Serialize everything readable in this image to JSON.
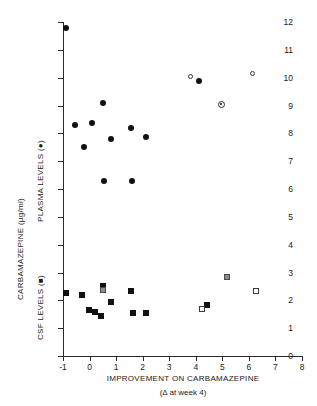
{
  "chart_data": {
    "type": "scatter",
    "title": "",
    "xlabel": "IMPROVEMENT ON CARBAMAZEPINE",
    "xlabel_sub": "(Δ at week 4)",
    "ylabel": "CARBAMAZEPINE (µg/ml)",
    "ylabel_upper": "PLASMA LEVELS (●)",
    "ylabel_lower": "CSF LEVELS (■)",
    "xlim": [
      -1,
      8
    ],
    "ylim": [
      0,
      12
    ],
    "xticks": [
      -1,
      0,
      1,
      2,
      3,
      4,
      5,
      6,
      7,
      8
    ],
    "xtick_labels": [
      "-1",
      "0",
      "1",
      "2",
      "3",
      "4",
      "5",
      "6",
      "7",
      "8"
    ],
    "yticks": [
      0,
      1,
      2,
      3,
      4,
      5,
      6,
      7,
      8,
      9,
      10,
      11,
      12
    ],
    "ytick_labels": [
      "0",
      "1",
      "2",
      "3",
      "4",
      "5",
      "6",
      "7",
      "8",
      "9",
      "10",
      "11",
      "12"
    ],
    "grid": false,
    "legend_position": "none",
    "series": [
      {
        "name": "PLASMA LEVELS (●)",
        "marker": "circle-filled",
        "points": [
          {
            "x": -0.88,
            "y": 11.8
          },
          {
            "x": -0.55,
            "y": 8.3
          },
          {
            "x": -0.22,
            "y": 7.5
          },
          {
            "x": 0.08,
            "y": 8.38
          },
          {
            "x": 0.52,
            "y": 9.08
          },
          {
            "x": 0.55,
            "y": 6.28
          },
          {
            "x": 0.82,
            "y": 7.78
          },
          {
            "x": 1.55,
            "y": 8.18
          },
          {
            "x": 1.6,
            "y": 6.28
          },
          {
            "x": 2.12,
            "y": 7.88
          },
          {
            "x": 4.12,
            "y": 9.88
          }
        ]
      },
      {
        "name": "PLASMA LEVELS (open)",
        "marker": "circle-open",
        "points": [
          {
            "x": 3.8,
            "y": 10.05
          },
          {
            "x": 6.15,
            "y": 10.15
          }
        ]
      },
      {
        "name": "PLASMA LEVELS (circle-dot)",
        "marker": "circle-dot",
        "points": [
          {
            "x": 4.95,
            "y": 9.05
          }
        ]
      },
      {
        "name": "CSF LEVELS (■)",
        "marker": "square-filled",
        "points": [
          {
            "x": -0.88,
            "y": 2.28
          },
          {
            "x": -0.28,
            "y": 2.18
          },
          {
            "x": -0.02,
            "y": 1.67
          },
          {
            "x": 0.22,
            "y": 1.58
          },
          {
            "x": 0.42,
            "y": 1.45
          },
          {
            "x": 0.52,
            "y": 2.52
          },
          {
            "x": 0.82,
            "y": 1.93
          },
          {
            "x": 1.55,
            "y": 2.32
          },
          {
            "x": 1.62,
            "y": 1.53
          },
          {
            "x": 2.12,
            "y": 1.56
          },
          {
            "x": 4.42,
            "y": 1.84
          }
        ]
      },
      {
        "name": "CSF LEVELS (grey)",
        "marker": "square-grey",
        "points": [
          {
            "x": 0.5,
            "y": 2.38
          },
          {
            "x": 5.18,
            "y": 2.84
          }
        ]
      },
      {
        "name": "CSF LEVELS (open)",
        "marker": "square-open",
        "points": [
          {
            "x": 4.22,
            "y": 1.68
          },
          {
            "x": 6.28,
            "y": 2.35
          }
        ]
      }
    ]
  }
}
